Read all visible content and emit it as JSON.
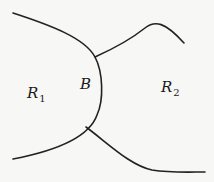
{
  "diagram": {
    "type": "region-boundary",
    "labels": {
      "region1": {
        "main": "R",
        "sub": "1"
      },
      "boundary": {
        "main": "B"
      },
      "region2": {
        "main": "R",
        "sub": "2"
      }
    },
    "colors": {
      "stroke": "#222222",
      "background": "#f7f7f5"
    }
  }
}
